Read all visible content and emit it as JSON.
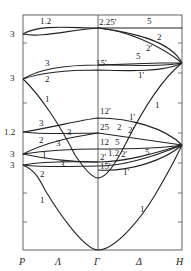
{
  "diagram": {
    "type": "band-structure",
    "x_axis_labels": [
      "P",
      "Λ",
      "Γ",
      "Δ",
      "H"
    ],
    "left_degeneracy_labels": [
      "3",
      "3",
      "1.2",
      "3",
      "3"
    ],
    "band_labels_left": [
      "1.2",
      "3",
      "2",
      "1",
      "3",
      "3",
      "2",
      "3",
      "1",
      "3",
      "2",
      "1"
    ],
    "gamma_labels": [
      "2.25'",
      "15'",
      "12'",
      "25",
      "12",
      "2'",
      "1.2",
      "15'"
    ],
    "band_labels_right": [
      "5",
      "2",
      "2'",
      "5",
      "1'",
      "1",
      "1'",
      "2",
      "2'",
      "5",
      "2'",
      "5",
      "1'",
      "1"
    ]
  }
}
